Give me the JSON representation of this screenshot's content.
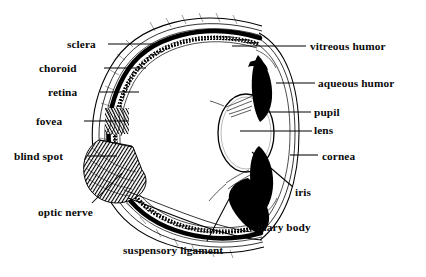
{
  "diagram": {
    "domain_type": "anatomical-line-drawing",
    "width": 426,
    "height": 277,
    "ink_color": "#000000",
    "background_color": "#ffffff"
  },
  "labels": [
    {
      "id": "sclera",
      "text": "sclera",
      "side": "left",
      "x": 67,
      "y": 38,
      "leader": "solid-line"
    },
    {
      "id": "choroid",
      "text": "choroid",
      "side": "left",
      "x": 39,
      "y": 62,
      "leader": "solid-line"
    },
    {
      "id": "retina",
      "text": "retina",
      "side": "left",
      "x": 48,
      "y": 86,
      "leader": "solid-line"
    },
    {
      "id": "fovea",
      "text": "fovea",
      "side": "left",
      "x": 36,
      "y": 115,
      "leader": "solid-line"
    },
    {
      "id": "blind-spot",
      "text": "blind spot",
      "side": "left",
      "x": 14,
      "y": 150,
      "leader": "solid-line"
    },
    {
      "id": "optic-nerve",
      "text": "optic nerve",
      "side": "left",
      "x": 38,
      "y": 206,
      "leader": "angled-line"
    },
    {
      "id": "suspensory-ligament",
      "text": "suspensory ligament",
      "side": "below",
      "x": 123,
      "y": 244,
      "leader": "angled-line"
    },
    {
      "id": "ciliary-body",
      "text": "ciliary body",
      "side": "below",
      "x": 252,
      "y": 221,
      "leader": "angled-line"
    },
    {
      "id": "iris",
      "text": "iris",
      "side": "right",
      "x": 295,
      "y": 186,
      "leader": "angled-line"
    },
    {
      "id": "cornea",
      "text": "cornea",
      "side": "right",
      "x": 322,
      "y": 150,
      "leader": "solid-line"
    },
    {
      "id": "lens",
      "text": "lens",
      "side": "right",
      "x": 314,
      "y": 124,
      "leader": "solid-line"
    },
    {
      "id": "pupil",
      "text": "pupil",
      "side": "right",
      "x": 314,
      "y": 106,
      "leader": "solid-line"
    },
    {
      "id": "aqueous-humor",
      "text": "aqueous humor",
      "side": "right",
      "x": 318,
      "y": 77,
      "leader": "solid-line"
    },
    {
      "id": "vitreous-humor",
      "text": "vitreous humor",
      "side": "right",
      "x": 310,
      "y": 40,
      "leader": "solid-line"
    }
  ],
  "structures": [
    {
      "id": "sclera-wall",
      "name": "sclera",
      "render": "outer-double-line-band"
    },
    {
      "id": "choroid-wall",
      "name": "choroid",
      "render": "thick-black-band"
    },
    {
      "id": "retina-wall",
      "name": "retina",
      "render": "stippled-band"
    },
    {
      "id": "fovea-notch",
      "name": "fovea",
      "render": "hatched-indent"
    },
    {
      "id": "blind-spot-zone",
      "name": "blind spot",
      "render": "hatched-block"
    },
    {
      "id": "optic-nerve-stalk",
      "name": "optic nerve",
      "render": "hatched-stalk"
    },
    {
      "id": "lens-body",
      "name": "lens",
      "render": "white-ellipse"
    },
    {
      "id": "iris-upper",
      "name": "iris (upper)",
      "render": "solid-black-wedge"
    },
    {
      "id": "iris-lower",
      "name": "iris (lower)",
      "render": "solid-black-wedge"
    },
    {
      "id": "pupil-gap",
      "name": "pupil",
      "render": "aperture-gap"
    },
    {
      "id": "cornea-arc",
      "name": "cornea",
      "render": "thin-arc-pair"
    },
    {
      "id": "vitreous-chamber",
      "name": "vitreous humor",
      "render": "white-interior"
    },
    {
      "id": "aqueous-chamber",
      "name": "aqueous humor",
      "render": "white-anterior"
    },
    {
      "id": "ciliary-body-mass",
      "name": "ciliary body",
      "render": "solid-black-mass"
    },
    {
      "id": "zonule-fibers",
      "name": "suspensory ligament",
      "render": "fine-fiber-lines"
    }
  ]
}
